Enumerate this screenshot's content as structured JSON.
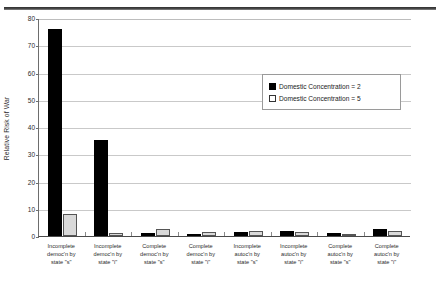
{
  "chart_data": {
    "type": "bar",
    "title": "",
    "xlabel": "",
    "ylabel": "Relative Risk of War",
    "ylim": [
      0,
      80
    ],
    "yticks": [
      0,
      10,
      20,
      30,
      40,
      50,
      60,
      70,
      80
    ],
    "grid": true,
    "legend_position": "upper-right",
    "categories": [
      "Incomplete democ'n by state \"s\"",
      "Incomplete democ'n by state \"i\"",
      "Complete democ'n by state \"s\"",
      "Complete democ'n by state \"i\"",
      "Incomplete autoc'n by state \"s\"",
      "Incomplete autoc'n by state \"i\"",
      "Complete autoc'n by state \"s\"",
      "Complete autoc'n by state \"i\""
    ],
    "category_lines": [
      [
        "Incomplete",
        "democ'n by",
        "state \"s\""
      ],
      [
        "Incomplete",
        "democ'n by",
        "state \"i\""
      ],
      [
        "Complete",
        "democ'n by",
        "state \"s\""
      ],
      [
        "Complete",
        "democ'n by",
        "state \"i\""
      ],
      [
        "Incomplete",
        "autoc'n by",
        "state \"s\""
      ],
      [
        "Incomplete",
        "autoc'n by",
        "state \"i\""
      ],
      [
        "Complete",
        "autoc'n by",
        "state \"s\""
      ],
      [
        "Complete",
        "autoc'n by",
        "state \"i\""
      ]
    ],
    "series": [
      {
        "name": "Domestic Concentration = 2",
        "color": "#000000",
        "values": [
          76.0,
          35.3,
          1.2,
          0.9,
          1.5,
          2.0,
          1.1,
          2.6
        ]
      },
      {
        "name": "Domestic Concentration = 5",
        "color": "#d9d9d9",
        "values": [
          8.0,
          1.0,
          2.5,
          1.3,
          1.7,
          1.6,
          0.8,
          1.8
        ]
      }
    ]
  },
  "legend": {
    "items": [
      {
        "label": "Domestic Concentration = 2",
        "swatch": "filled-black-square"
      },
      {
        "label": "Domestic Concentration = 5",
        "swatch": "outlined-white-square"
      }
    ]
  }
}
